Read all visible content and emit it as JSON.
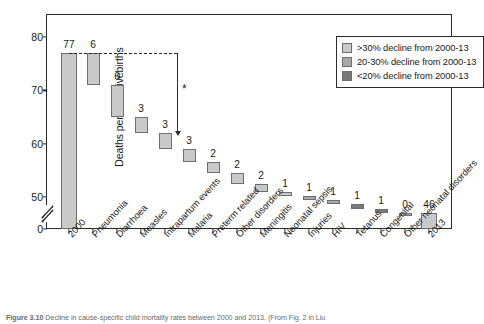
{
  "chart_data": {
    "type": "bar",
    "title": "",
    "subtitle": "",
    "xlabel": "",
    "ylabel": "Deaths per 1000 livebirths",
    "ylim": [
      0,
      82
    ],
    "yticks": [
      0,
      50,
      60,
      70,
      80
    ],
    "ytick_labels": [
      "0",
      "50",
      "60",
      "70",
      "80"
    ],
    "axis_break": true,
    "grid": false,
    "legend_position": "top-right",
    "categories": [
      "2000",
      "Pneumonia",
      "Diarrhoea",
      "Measles",
      "Intrapartum events",
      "Malaria",
      "Preterm related",
      "Other disorders",
      "Meningitis",
      "Neonatal sepsis",
      "Injuries",
      "HIV",
      "Tetanus",
      "Congenital",
      "Other neonatal disorders",
      "2013"
    ],
    "values": [
      77,
      6,
      6,
      3,
      3,
      3,
      2,
      2,
      2,
      1,
      1,
      1,
      1,
      1,
      0,
      46
    ],
    "value_labels": [
      "77",
      "6",
      "6",
      "3",
      "3",
      "3",
      "2",
      "2",
      "2",
      "1",
      "1",
      "1",
      "1",
      "1",
      "0",
      "46"
    ],
    "bar_kind": [
      "total",
      "step",
      "step",
      "step",
      "step",
      "step",
      "step",
      "step",
      "step",
      "step",
      "step",
      "step",
      "step",
      "step",
      "step",
      "total"
    ],
    "bar_tops": [
      77,
      77,
      71,
      65,
      62,
      59,
      56.5,
      54.5,
      52.5,
      51,
      50.2,
      49.4,
      48.6,
      47.8,
      47,
      46
    ],
    "bar_bottoms": [
      0,
      71,
      65,
      62,
      59,
      56.5,
      54.5,
      52.5,
      51,
      50.2,
      49.4,
      48.6,
      47.8,
      47,
      47,
      0
    ],
    "color_class": [
      "light",
      "light",
      "light",
      "light",
      "light",
      "light",
      "light",
      "light",
      "light",
      "light",
      "medium",
      "medium",
      "dark",
      "dark",
      "medium",
      "light"
    ],
    "annotation_marker": "*"
  },
  "legend": {
    "items": [
      {
        "label": ">30% decline from 2000-13",
        "swatch": "light",
        "color": "#c9c9c9"
      },
      {
        "label": "20-30% decline from 2000-13",
        "swatch": "medium",
        "color": "#a8a8a8"
      },
      {
        "label": "<20% decline from 2000-13",
        "swatch": "dark",
        "color": "#787878"
      }
    ]
  },
  "colors": {
    "light": "#c9c9c9",
    "medium": "#a8a8a8",
    "dark": "#787878",
    "axis": "#2b2b2b",
    "bar_border": "#6e6e6e"
  },
  "caption": {
    "number": "Figure 3.10",
    "text": "Decline in cause-specific child mortality rates between 2000 and 2013. (From Fig. 2 in Liu"
  }
}
